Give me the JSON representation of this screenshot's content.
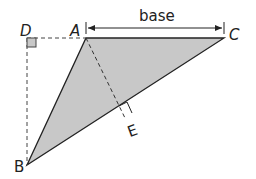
{
  "diagram": {
    "type": "triangle-area",
    "points": {
      "A": {
        "label": "A",
        "x": 86,
        "y": 38
      },
      "B": {
        "label": "B",
        "x": 27,
        "y": 165
      },
      "C": {
        "label": "C",
        "x": 224,
        "y": 38
      },
      "D": {
        "label": "D",
        "x": 27,
        "y": 38
      },
      "E": {
        "label": "E",
        "x": 125,
        "y": 118
      }
    },
    "base_label": "base",
    "fill_color": "#c8c8c8",
    "stroke_color": "#222222"
  }
}
